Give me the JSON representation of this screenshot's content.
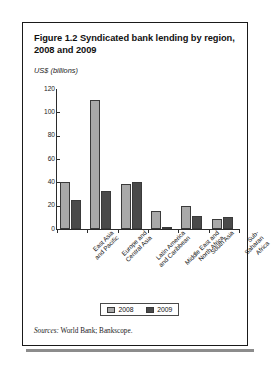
{
  "figure": {
    "title": "Figure 1.2  Syndicated bank lending by region, 2008 and 2009",
    "unit_label": "US$ (billions)",
    "sources_lead": "Sources:",
    "sources_text": " World Bank; Bankscope."
  },
  "legend": {
    "items": [
      {
        "label": "2008",
        "color": "#a9a9a9"
      },
      {
        "label": "2009",
        "color": "#4a4a4a"
      }
    ]
  },
  "chart_data": {
    "type": "bar",
    "title": "Figure 1.2  Syndicated bank lending by region, 2008 and 2009",
    "xlabel": "",
    "ylabel": "US$ (billions)",
    "ylim": [
      0,
      120
    ],
    "yticks": [
      0,
      20,
      40,
      60,
      80,
      100,
      120
    ],
    "ytick_labels": [
      "0",
      "20",
      "40",
      "60",
      "80",
      "100",
      "120"
    ],
    "grid": false,
    "legend_position": "bottom",
    "categories": [
      "East Asia and Pacific",
      "Europe and Central Asia",
      "Latin America and Caribbean",
      "Middle East and North Africa",
      "South Asia",
      "Sub-Saharan Africa"
    ],
    "category_lines": [
      [
        "East Asia",
        "and Pacific"
      ],
      [
        "Europe and",
        "Central Asia"
      ],
      [
        "Latin America",
        "and Caribbean"
      ],
      [
        "Middle East and",
        "North Africa"
      ],
      [
        "South Asia"
      ],
      [
        "Sub-Saharan",
        "Africa"
      ]
    ],
    "series": [
      {
        "name": "2008",
        "color": "#a9a9a9",
        "values": [
          40,
          111,
          38.5,
          15.5,
          19.5,
          9
        ]
      },
      {
        "name": "2009",
        "color": "#4a4a4a",
        "values": [
          25,
          33,
          40.5,
          2,
          11,
          10
        ]
      }
    ],
    "sources": "Sources: World Bank; Bankscope."
  }
}
